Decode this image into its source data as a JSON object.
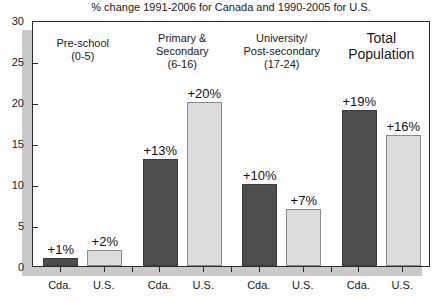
{
  "chart_data": {
    "type": "bar",
    "title": "% change 1991-2006 for Canada and 1990-2005 for U.S.",
    "xlabel": "",
    "ylabel": "",
    "ylim": [
      0,
      30
    ],
    "ytick_labels": [
      "0",
      "5",
      "10",
      "15",
      "20",
      "25",
      "30"
    ],
    "ytick_values": [
      0,
      5,
      10,
      15,
      20,
      25,
      30
    ],
    "grid": false,
    "legend": "none",
    "categories": [
      {
        "lines": [
          "Pre-school",
          "(0-5)"
        ],
        "size": "normal",
        "bars": [
          {
            "series": "Cda.",
            "value": 1,
            "label": "+1%"
          },
          {
            "series": "U.S.",
            "value": 2,
            "label": "+2%"
          }
        ]
      },
      {
        "lines": [
          "Primary &",
          "Secondary",
          "(6-16)"
        ],
        "size": "normal",
        "bars": [
          {
            "series": "Cda.",
            "value": 13,
            "label": "+13%"
          },
          {
            "series": "U.S.",
            "value": 20,
            "label": "+20%"
          }
        ]
      },
      {
        "lines": [
          "University/",
          "Post-secondary",
          "(17-24)"
        ],
        "size": "normal",
        "bars": [
          {
            "series": "Cda.",
            "value": 10,
            "label": "+10%"
          },
          {
            "series": "U.S.",
            "value": 7,
            "label": "+7%"
          }
        ]
      },
      {
        "lines": [
          "Total",
          "Population"
        ],
        "size": "big",
        "bars": [
          {
            "series": "Cda.",
            "value": 19,
            "label": "+19%"
          },
          {
            "series": "U.S.",
            "value": 16,
            "label": "+16%"
          }
        ]
      }
    ],
    "series": [
      {
        "name": "Cda.",
        "values": [
          1,
          13,
          10,
          19
        ],
        "color": "#4d4d4d"
      },
      {
        "name": "U.S.",
        "values": [
          2,
          20,
          7,
          16
        ],
        "color": "#dcdcdc"
      }
    ],
    "x_tick_labels": [
      "Cda.",
      "U.S.",
      "Cda.",
      "U.S.",
      "Cda.",
      "U.S.",
      "Cda.",
      "U.S."
    ]
  },
  "colors": {
    "canada_bar": "#4d4d4d",
    "us_bar": "#dcdcdc",
    "axis": "#2b2b2b",
    "shadow": "#c9c9c9",
    "text": "#111111",
    "background": "#ffffff"
  }
}
